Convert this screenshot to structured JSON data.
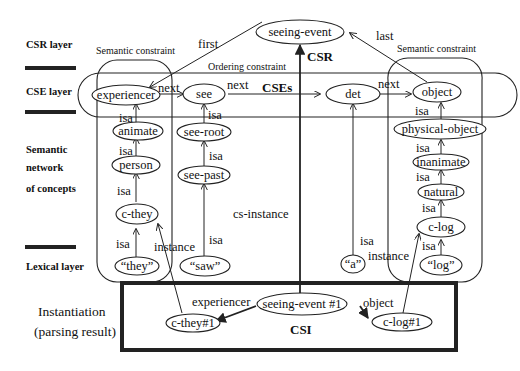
{
  "layers": {
    "csr": "CSR layer",
    "cse": "CSE layer",
    "semantic_1": "Semantic",
    "semantic_2": "network",
    "semantic_3": "of concepts",
    "lexical": "Lexical layer",
    "instantiation_1": "Instantiation",
    "instantiation_2": "(parsing result)"
  },
  "regions": {
    "semantic_constraint_left": "Semantic constraint",
    "semantic_constraint_right": "Semantic constraint",
    "ordering_constraint": "Ordering constraint",
    "csr": "CSR",
    "cses": "CSEs",
    "csi": "CSI"
  },
  "nodes": {
    "seeing_event": "seeing-event",
    "experiencer": "experiencer",
    "see": "see",
    "det": "det",
    "object": "object",
    "animate": "animate",
    "person": "person",
    "c_they": "c-they",
    "they": "“they”",
    "see_root": "see-root",
    "see_past": "see-past",
    "saw": "“saw”",
    "a": "“a”",
    "physical_object": "physical-object",
    "inanimate": "inanimate",
    "natural": "natural",
    "c_log": "c-log",
    "log": "“log”",
    "seeing_event_1": "seeing-event #1",
    "c_they_1": "c-they#1",
    "c_log_1": "c-log#1"
  },
  "edges": {
    "first": "first",
    "last": "last",
    "next1": "next",
    "next2": "next",
    "next3": "next",
    "isa": "isa",
    "instance": "instance",
    "cs_instance": "cs-instance",
    "experiencer": "experiencer",
    "object": "object"
  }
}
